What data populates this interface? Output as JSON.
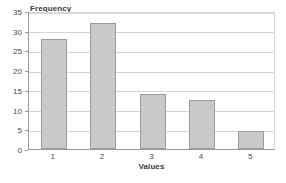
{
  "chart_data": {
    "type": "bar",
    "title": "",
    "subtitle": "",
    "xlabel": "Values",
    "ylabel": "Frequency",
    "categories": [
      "1",
      "2",
      "3",
      "4",
      "5"
    ],
    "values": [
      28,
      32,
      14,
      12.5,
      4.5
    ],
    "series": [
      {
        "name": "Frequency",
        "values": [
          28,
          32,
          14,
          12.5,
          4.5
        ]
      }
    ],
    "ylim": [
      0,
      35
    ],
    "xlim": [
      0,
      5
    ],
    "ytick_labels": [
      "0",
      "5",
      "10",
      "15",
      "20",
      "25",
      "30",
      "35"
    ],
    "ytick_values": [
      0,
      5,
      10,
      15,
      20,
      25,
      30,
      35
    ],
    "xtick_labels": [
      "1",
      "2",
      "3",
      "4",
      "5"
    ],
    "grid": true,
    "grid_axis": "y",
    "legend": false,
    "legend_position": "none",
    "annotations": [],
    "colors": {
      "bar_fill": "#c9c9c9",
      "bar_border": "#9b9b9b",
      "gridline": "#d5d5d5",
      "axis": "#9a9a9a",
      "text": "#4a4a4a",
      "title_text": "#3a3a3a",
      "background": "#ffffff"
    }
  }
}
